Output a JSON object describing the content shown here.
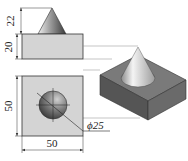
{
  "figure": {
    "type": "orthographic-and-isometric-drawing",
    "object": "square block with cone on top"
  },
  "front_view": {
    "dimensions": {
      "cone_height": "22",
      "block_height": "20"
    }
  },
  "top_view": {
    "dimensions": {
      "width": "50",
      "depth": "50",
      "cone_diameter": "ϕ25"
    }
  },
  "colors": {
    "block_face": "#d4d4d4",
    "outline": "#333333",
    "iso_top": "#7a7a7a",
    "iso_left": "#555555",
    "iso_right": "#6a6a6a"
  }
}
